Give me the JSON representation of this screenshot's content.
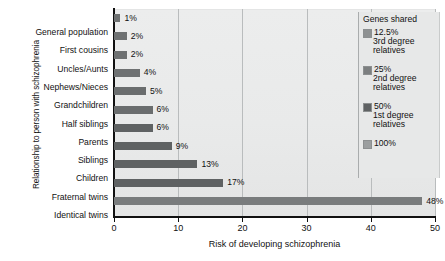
{
  "chart_data": {
    "type": "bar",
    "orientation": "horizontal",
    "title": "",
    "xlabel": "Risk of developing schizophrenia",
    "ylabel": "Relationship to person with schizophrenia",
    "xlim": [
      0,
      50
    ],
    "xticks": [
      0,
      10,
      20,
      30,
      40,
      50
    ],
    "grid": true,
    "legend_position": "top-right",
    "categories": [
      "General population",
      "First cousins",
      "Uncles/Aunts",
      "Nephews/Nieces",
      "Grandchildren",
      "Half siblings",
      "Parents",
      "Siblings",
      "Children",
      "Fraternal twins",
      "Identical twins"
    ],
    "values": [
      1,
      2,
      2,
      4,
      5,
      6,
      6,
      9,
      13,
      17,
      48
    ],
    "value_labels": [
      "1%",
      "2%",
      "2%",
      "4%",
      "5%",
      "6%",
      "6%",
      "9%",
      "13%",
      "17%",
      "48%"
    ],
    "bar_groups": [
      "12.5%",
      "12.5%",
      "12.5%",
      "12.5%",
      "25%",
      "25%",
      "50%",
      "50%",
      "50%",
      "50%",
      "100%"
    ],
    "bar_colors": [
      "#6e7172",
      "#6e7172",
      "#6e7172",
      "#6e7172",
      "#6a6d6e",
      "#6a6d6e",
      "#5f6263",
      "#5f6263",
      "#5f6263",
      "#5f6263",
      "#797c7d"
    ],
    "legend": {
      "title": "Genes shared",
      "entries": [
        {
          "percent": "12.5%",
          "line1": "3rd degree",
          "line2": "relatives",
          "color": "#8e9192"
        },
        {
          "percent": "25%",
          "line1": "2nd degree",
          "line2": "relatives",
          "color": "#7c7f80"
        },
        {
          "percent": "50%",
          "line1": "1st degree",
          "line2": "relatives",
          "color": "#5f6263"
        },
        {
          "percent": "100%",
          "line1": "",
          "line2": "",
          "color": "#9b9e9f"
        }
      ]
    }
  },
  "colors": {
    "plot_background": "#e9eaea",
    "gridline": "#b9bcbd",
    "axis": "#111111",
    "text": "#111111"
  }
}
